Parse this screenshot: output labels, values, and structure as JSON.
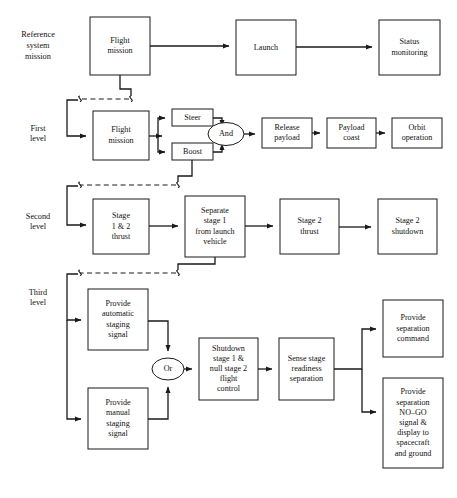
{
  "diagram": {
    "type": "functional-flow-block-diagram",
    "colors": {
      "line": "#1a1a1a",
      "box_fill": "#ffffff",
      "text": "#111111",
      "background": "#ffffff"
    },
    "row_labels": [
      {
        "name": "reference-system-mission",
        "lines": [
          "Reference",
          "system",
          "mission"
        ],
        "x": 38,
        "y": 46
      },
      {
        "name": "first-level",
        "lines": [
          "First",
          "level"
        ],
        "x": 38,
        "y": 134
      },
      {
        "name": "second-level",
        "lines": [
          "Second",
          "level"
        ],
        "x": 38,
        "y": 222
      },
      {
        "name": "third-level",
        "lines": [
          "Third",
          "level"
        ],
        "x": 38,
        "y": 298
      }
    ],
    "boxes": [
      {
        "name": "flight-mission-reference",
        "lines": [
          "Flight",
          "mission"
        ],
        "x": 90,
        "y": 17,
        "w": 60,
        "h": 58
      },
      {
        "name": "launch",
        "lines": [
          "Launch"
        ],
        "x": 236,
        "y": 20,
        "w": 60,
        "h": 55
      },
      {
        "name": "status-monitoring",
        "lines": [
          "Status",
          "monitoring"
        ],
        "x": 379,
        "y": 20,
        "w": 61,
        "h": 55
      },
      {
        "name": "flight-mission-first-level",
        "lines": [
          "Flight",
          "mission"
        ],
        "x": 93,
        "y": 111,
        "w": 56,
        "h": 49
      },
      {
        "name": "steer",
        "lines": [
          "Steer"
        ],
        "x": 172,
        "y": 109,
        "w": 41,
        "h": 17
      },
      {
        "name": "boost",
        "lines": [
          "Boost"
        ],
        "x": 172,
        "y": 143,
        "w": 41,
        "h": 17
      },
      {
        "name": "release-payload",
        "lines": [
          "Release",
          "payload"
        ],
        "x": 262,
        "y": 118,
        "w": 50,
        "h": 30
      },
      {
        "name": "payload-coast",
        "lines": [
          "Payload",
          "coast"
        ],
        "x": 327,
        "y": 118,
        "w": 49,
        "h": 30
      },
      {
        "name": "orbit-operation",
        "lines": [
          "Orbit",
          "operation"
        ],
        "x": 392,
        "y": 118,
        "w": 50,
        "h": 30
      },
      {
        "name": "stage-1-2-thrust",
        "lines": [
          "Stage",
          "1 & 2",
          "thrust"
        ],
        "x": 93,
        "y": 199,
        "w": 56,
        "h": 55
      },
      {
        "name": "separate-stage-1",
        "lines": [
          "Separate",
          "stage 1",
          "from launch",
          "vehicle"
        ],
        "x": 185,
        "y": 196,
        "w": 60,
        "h": 61
      },
      {
        "name": "stage-2-thrust",
        "lines": [
          "Stage 2",
          "thrust"
        ],
        "x": 280,
        "y": 199,
        "w": 59,
        "h": 55
      },
      {
        "name": "stage-2-shutdown",
        "lines": [
          "Stage 2",
          "shutdown"
        ],
        "x": 378,
        "y": 199,
        "w": 59,
        "h": 55
      },
      {
        "name": "provide-automatic-staging-signal",
        "lines": [
          "Provide",
          "automatic",
          "staging",
          "signal"
        ],
        "x": 88,
        "y": 289,
        "w": 60,
        "h": 61
      },
      {
        "name": "shutdown-stage-1-null-stage-2",
        "lines": [
          "Shutdown",
          "stage 1 &",
          "null stage 2",
          "flight",
          "control"
        ],
        "x": 199,
        "y": 338,
        "w": 59,
        "h": 62
      },
      {
        "name": "sense-stage-readiness-separation",
        "lines": [
          "Sense stage",
          "readiness",
          "separation"
        ],
        "x": 279,
        "y": 338,
        "w": 55,
        "h": 62
      },
      {
        "name": "provide-separation-command",
        "lines": [
          "Provide",
          "separation",
          "command"
        ],
        "x": 383,
        "y": 300,
        "w": 60,
        "h": 57
      },
      {
        "name": "provide-manual-staging-signal",
        "lines": [
          "Provide",
          "manual",
          "staging",
          "signal"
        ],
        "x": 88,
        "y": 388,
        "w": 60,
        "h": 61
      },
      {
        "name": "provide-separation-no-go-signal",
        "lines": [
          "Provide",
          "separation",
          "NO–GO",
          "signal &",
          "display to",
          "spacecraft",
          "and ground"
        ],
        "x": 383,
        "y": 378,
        "w": 60,
        "h": 90
      }
    ],
    "gates": [
      {
        "name": "and-gate",
        "label": "And",
        "cx": 226,
        "cy": 134,
        "rx": 18,
        "ry": 11.5
      },
      {
        "name": "or-gate",
        "label": "Or",
        "cx": 168,
        "cy": 369,
        "rx": 16,
        "ry": 11
      }
    ]
  }
}
